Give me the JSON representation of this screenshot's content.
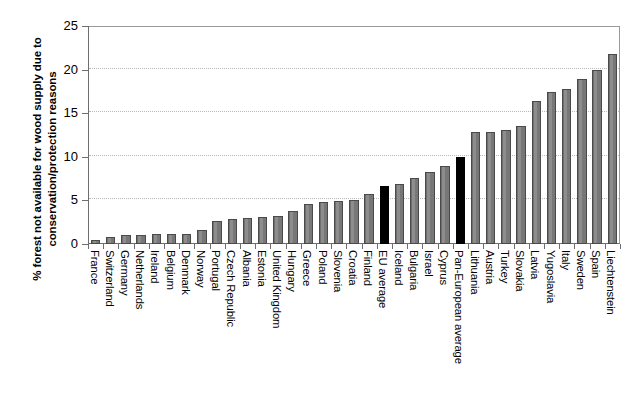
{
  "chart_data": {
    "type": "bar",
    "title": "",
    "xlabel": "",
    "ylabel": "% forest not available for wood supply due to conservation/protection reasons",
    "ylabel_line1": "% forest not available for wood supply due to",
    "ylabel_line2": "conservation/protection reasons",
    "ylim": [
      0,
      25
    ],
    "ytick_labels": [
      "0",
      "5",
      "10",
      "15",
      "20",
      "25"
    ],
    "ytick_values": [
      0,
      5,
      10,
      15,
      20,
      25
    ],
    "grid": true,
    "grid_axis": "y",
    "legend": "none",
    "bar_color": "#808080",
    "highlight_color": "#000000",
    "highlight_categories": [
      "EU average",
      "Pan-European average"
    ],
    "categories": [
      "France",
      "Switzerland",
      "Germany",
      "Netherlands",
      "Ireland",
      "Belgium",
      "Denmark",
      "Norway",
      "Portugal",
      "Czech Republic",
      "Albania",
      "Estonia",
      "United Kingdom",
      "Hungary",
      "Greece",
      "Poland",
      "Slovenia",
      "Croatia",
      "Finland",
      "EU average",
      "Iceland",
      "Bulgaria",
      "Israel",
      "Cyprus",
      "Pan-European average",
      "Lithuania",
      "Austria",
      "Turkey",
      "Slovakia",
      "Latvia",
      "Yugoslavia",
      "Italy",
      "Sweden",
      "Spain",
      "Liechtenstein"
    ],
    "values": [
      0.5,
      0.8,
      1.0,
      1.0,
      1.1,
      1.1,
      1.2,
      1.6,
      2.6,
      2.9,
      3.0,
      3.1,
      3.2,
      3.8,
      4.6,
      4.8,
      4.9,
      5.0,
      5.7,
      6.6,
      6.9,
      7.6,
      8.3,
      8.9,
      10.0,
      12.8,
      12.9,
      13.1,
      13.5,
      16.4,
      17.4,
      17.8,
      18.9,
      19.9,
      21.8
    ]
  }
}
